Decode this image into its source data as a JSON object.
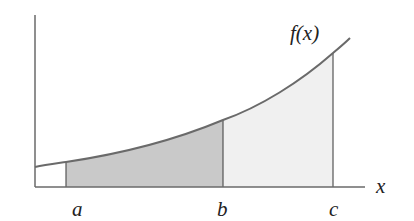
{
  "diagram": {
    "function_label": "f(x)",
    "axis_label_x": "x",
    "points": [
      {
        "name": "a",
        "label": "a"
      },
      {
        "name": "b",
        "label": "b"
      },
      {
        "name": "c",
        "label": "c"
      }
    ],
    "regions": [
      {
        "name": "area-a-to-b",
        "fill": "#c8c8c8"
      },
      {
        "name": "area-b-to-c",
        "fill": "#f0f0f0"
      }
    ],
    "colors": {
      "curve": "#6a6a6a",
      "axis": "#6a6a6a",
      "dark_fill": "#c8c8c8",
      "light_fill": "#f0f0f0"
    }
  }
}
